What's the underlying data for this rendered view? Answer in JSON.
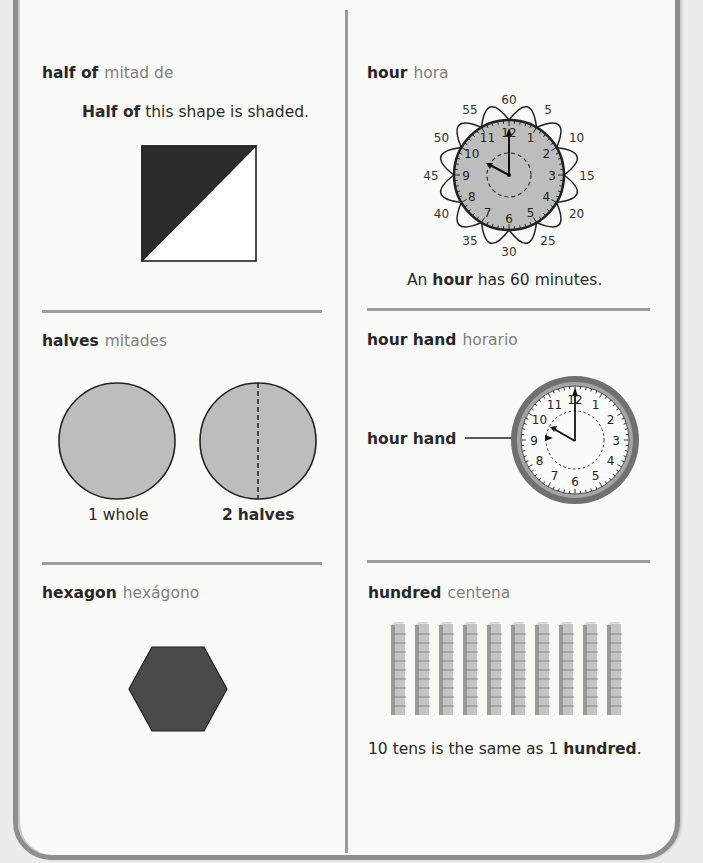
{
  "page": {
    "colors": {
      "ink": "#262626",
      "spanish": "#808080",
      "frame": "#8e8e8e",
      "shape_gray": "#bdbdbd",
      "shape_dark": "#2c2c2c",
      "hexagon": "#4a4a4a"
    }
  },
  "entries": [
    {
      "id": "half-of",
      "term_en": "half of",
      "term_es": "mitad de",
      "caption_bold": "Half of",
      "caption_rest": " this shape is shaded.",
      "figure": "square-half-shaded-diagonal"
    },
    {
      "id": "hour",
      "term_en": "hour",
      "term_es": "hora",
      "caption_pre": "An ",
      "caption_bold": "hour",
      "caption_rest": " has 60 minutes.",
      "figure": "clock-with-minute-loops",
      "minute_labels": [
        "60",
        "5",
        "10",
        "15",
        "20",
        "25",
        "30",
        "35",
        "40",
        "45",
        "50",
        "55"
      ],
      "clock_numbers": [
        "12",
        "1",
        "2",
        "3",
        "4",
        "5",
        "6",
        "7",
        "8",
        "9",
        "10",
        "11"
      ],
      "time_shown": "10:00"
    },
    {
      "id": "halves",
      "term_en": "halves",
      "term_es": "mitades",
      "figure": "two-circles",
      "label_whole": "1 whole",
      "label_halves_num": "2",
      "label_halves_word": "halves"
    },
    {
      "id": "hour-hand",
      "term_en": "hour hand",
      "term_es": "horario",
      "figure": "wall-clock",
      "pointer_label": "hour hand",
      "clock_numbers": [
        "12",
        "1",
        "2",
        "3",
        "4",
        "5",
        "6",
        "7",
        "8",
        "9",
        "10",
        "11"
      ],
      "time_shown": "10:00"
    },
    {
      "id": "hexagon",
      "term_en": "hexagon",
      "term_es": "hexágono",
      "figure": "filled-hexagon"
    },
    {
      "id": "hundred",
      "term_en": "hundred",
      "term_es": "centena",
      "caption_pre": "10 tens is the same as 1 ",
      "caption_bold": "hundred",
      "caption_rest": ".",
      "figure": "ten-rods",
      "rod_count": 10,
      "cubes_per_rod": 10
    }
  ]
}
